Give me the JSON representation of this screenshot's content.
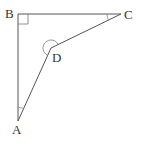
{
  "diagram": {
    "type": "geometry",
    "points": {
      "A": {
        "label": "A",
        "x": 18,
        "y": 121
      },
      "B": {
        "label": "B",
        "x": 18,
        "y": 14
      },
      "C": {
        "label": "C",
        "x": 121,
        "y": 14
      },
      "D": {
        "label": "D",
        "x": 51,
        "y": 48
      }
    },
    "segments": [
      "AB",
      "BC",
      "CD",
      "DA"
    ],
    "angle_marks": [
      {
        "vertex": "B",
        "kind": "right-angle"
      },
      {
        "vertex": "C",
        "kind": "arc"
      },
      {
        "vertex": "A",
        "kind": "arc"
      },
      {
        "vertex": "D",
        "kind": "reflex-arc"
      }
    ],
    "colors": {
      "stroke": "#555555",
      "label": "#333333"
    }
  }
}
